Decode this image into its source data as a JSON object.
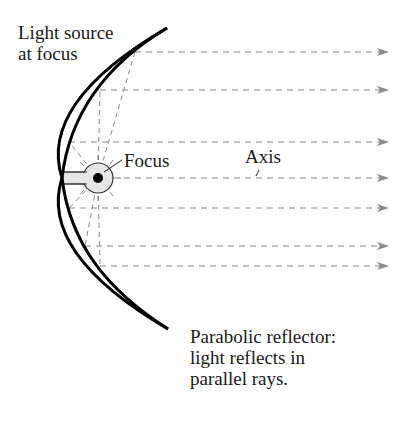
{
  "diagram": {
    "labels": {
      "light_source": [
        "Light source",
        "at focus"
      ],
      "focus": "Focus",
      "axis": "Axis",
      "reflector": [
        "Parabolic reflector:",
        "light reflects in",
        "parallel rays."
      ]
    },
    "colors": {
      "curve": "#000000",
      "rays": "#8a8a8a",
      "text": "#1a1a1a",
      "bulb_fill": "#e6e6e6",
      "bulb_dot": "#000000"
    },
    "parabola": {
      "top": [
        167,
        28
      ],
      "vertex": [
        62,
        178
      ],
      "bottom": [
        168,
        329
      ]
    },
    "focus_point": [
      98,
      178
    ],
    "rays": [
      {
        "y": 52,
        "reflect_x": 135
      },
      {
        "y": 90,
        "reflect_x": 100
      },
      {
        "y": 142,
        "reflect_x": 69
      },
      {
        "y": 178,
        "reflect_x": 113,
        "is_axis": true
      },
      {
        "y": 208,
        "reflect_x": 69
      },
      {
        "y": 246,
        "reflect_x": 85
      },
      {
        "y": 266,
        "reflect_x": 100
      }
    ],
    "arrow_end_x": 388
  }
}
